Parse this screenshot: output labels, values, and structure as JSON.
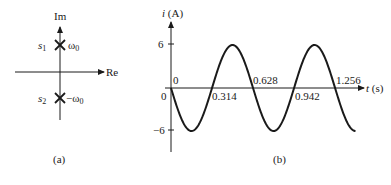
{
  "panel_a": {
    "caption": "(a)",
    "axis_im": "Im",
    "axis_re": "Re",
    "poles": [
      {
        "name": "s",
        "sub": "1",
        "value": "ω",
        "value_sub": "0",
        "sign": ""
      },
      {
        "name": "s",
        "sub": "2",
        "value": "ω",
        "value_sub": "0",
        "sign": "−"
      }
    ]
  },
  "panel_b": {
    "caption": "(b)",
    "ylabel_var": "i",
    "ylabel_unit": " (A)",
    "xlabel_var": "t",
    "xlabel_unit": " (s)",
    "y_ticks": [
      "6",
      "0",
      "−6"
    ],
    "x_ticks_above": [
      "0",
      "0.628",
      "1.256"
    ],
    "x_ticks_below": [
      "0.314",
      "0.942"
    ]
  },
  "chart_data": {
    "type": "line",
    "title": "",
    "xlabel": "t (s)",
    "ylabel": "i (A)",
    "function": "i(t) = -6 sin(10 t)",
    "x": [
      0,
      0.157,
      0.314,
      0.471,
      0.628,
      0.785,
      0.942,
      1.099,
      1.256,
      1.413
    ],
    "values": [
      0,
      -6,
      0,
      6,
      0,
      -6,
      0,
      6,
      0,
      -6
    ],
    "ylim": [
      -6,
      6
    ],
    "grid": false
  }
}
